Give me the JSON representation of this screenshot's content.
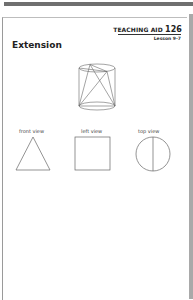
{
  "header": {
    "teaching_aid_label": "TEACHING AID",
    "teaching_aid_number": "126",
    "lesson": "Lesson 9-7"
  },
  "title": "Extension",
  "views": [
    {
      "label": "front view",
      "shape": "triangle"
    },
    {
      "label": "left view",
      "shape": "square"
    },
    {
      "label": "top view",
      "shape": "circle-with-vertical-line"
    }
  ]
}
